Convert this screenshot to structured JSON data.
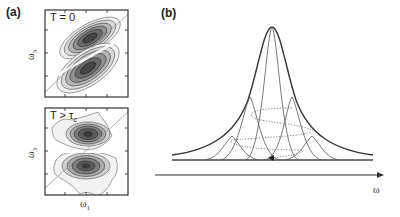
{
  "figure": {
    "panel_a": {
      "label": "(a)",
      "top_plot": {
        "title": "T = 0",
        "ylabel": "ω3",
        "ylabel_main": "ω",
        "ylabel_sub": "3"
      },
      "bottom_plot": {
        "title_main": "T > τ",
        "title_sub": "c",
        "ylabel_main": "ω",
        "ylabel_sub": "3",
        "xlabel_main": "ω",
        "xlabel_sub": "1"
      }
    },
    "panel_b": {
      "label": "(b)",
      "xlabel": "ω",
      "description": "Broad envelope lineshape composed of narrow sub-peaks connected by dotted spiral trajectory"
    },
    "colors": {
      "line": "#333333",
      "contour_fill": "#555555",
      "diagonal": "#888888"
    }
  }
}
